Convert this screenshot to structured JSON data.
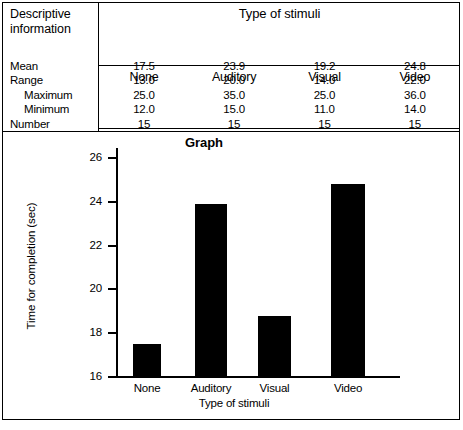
{
  "table": {
    "row_header_label": {
      "line1": "Descriptive",
      "line2": "information"
    },
    "group_header": "Type of stimuli",
    "columns": [
      "None",
      "Auditory",
      "Visual",
      "Video"
    ],
    "rows": [
      {
        "label": "Mean",
        "indent": false,
        "values": [
          "17.5",
          "23.9",
          "19.2",
          "24.8"
        ]
      },
      {
        "label": "Range",
        "indent": false,
        "values": [
          "13.0",
          "20.0",
          "14.0",
          "22.0"
        ]
      },
      {
        "label": "Maximum",
        "indent": true,
        "values": [
          "25.0",
          "35.0",
          "25.0",
          "36.0"
        ]
      },
      {
        "label": "Minimum",
        "indent": true,
        "values": [
          "12.0",
          "15.0",
          "11.0",
          "14.0"
        ]
      },
      {
        "label": "Number",
        "indent": false,
        "values": [
          "15",
          "15",
          "15",
          "15"
        ]
      }
    ]
  },
  "chart_data": {
    "type": "bar",
    "title": "Graph",
    "xlabel": "Type of stimuli",
    "ylabel": "Time for completion (sec)",
    "categories": [
      "None",
      "Auditory",
      "Visual",
      "Video"
    ],
    "values": [
      17.5,
      23.9,
      18.8,
      24.8
    ],
    "ylim": [
      16,
      26.5
    ],
    "yticks": [
      16,
      18,
      20,
      22,
      24,
      26
    ],
    "ytick_labels": [
      "16",
      "18",
      "20",
      "22",
      "24",
      "26"
    ],
    "grid": false,
    "legend": false,
    "bar_color": "#000000"
  }
}
